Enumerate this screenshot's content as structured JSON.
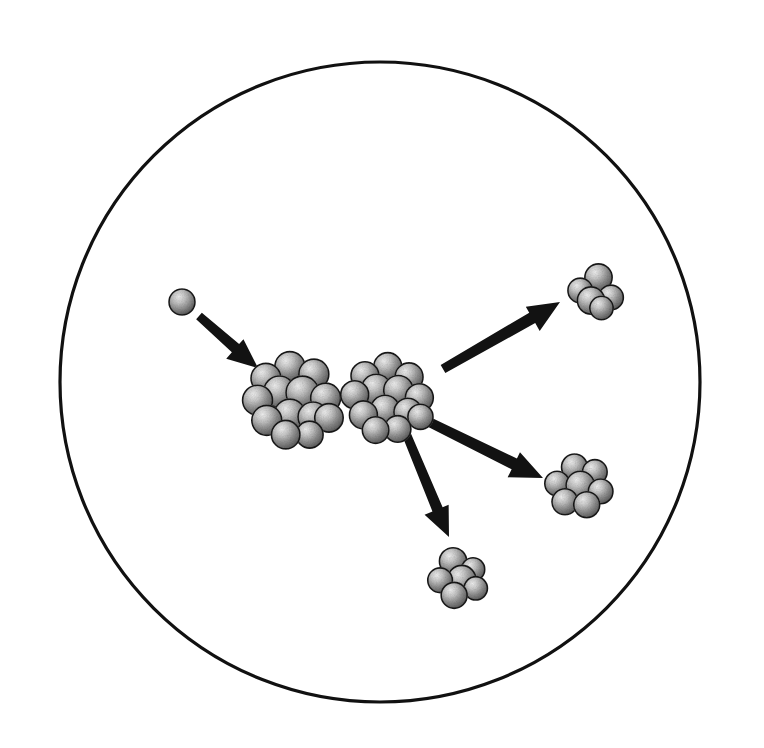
{
  "figure": {
    "title": "Nuclear fission of a heavy nucleus induced by a neutron",
    "background_color": "#ffffff",
    "outline_color": "#111111",
    "arrow_color": "#121212",
    "sphere_light": "#e8e8e8",
    "sphere_mid": "#8d8d8d",
    "sphere_dark": "#4a4a4a",
    "canvas": {
      "width": 764,
      "height": 748
    }
  },
  "vessel": {
    "name": "containment-circle",
    "center_x": 380,
    "center_y": 382,
    "radius": 320,
    "stroke_width": 3.2
  },
  "particles": [
    {
      "id": "incident-neutron",
      "label": "neutron",
      "kind": "single-nucleon",
      "center_x": 182,
      "center_y": 302,
      "radius": 13,
      "nucleon_count": 1
    },
    {
      "id": "target-nucleus",
      "label": "target nucleus",
      "kind": "cluster",
      "center_x": 292,
      "center_y": 396,
      "cluster_radius": 42,
      "nucleon_radius": 15,
      "nucleon_count": 13
    },
    {
      "id": "compound-nucleus",
      "label": "compound nucleus",
      "kind": "cluster",
      "center_x": 387,
      "center_y": 394,
      "cluster_radius": 38,
      "nucleon_radius": 14,
      "nucleon_count": 13
    },
    {
      "id": "fragment-upper-right",
      "label": "fission fragment",
      "kind": "cluster",
      "center_x": 594,
      "center_y": 293,
      "cluster_radius": 25,
      "nucleon_radius": 13,
      "nucleon_count": 5
    },
    {
      "id": "fragment-lower-right",
      "label": "fission fragment",
      "kind": "cluster",
      "center_x": 578,
      "center_y": 485,
      "cluster_radius": 29,
      "nucleon_radius": 13,
      "nucleon_count": 7
    },
    {
      "id": "fragment-bottom",
      "label": "fission fragment",
      "kind": "cluster",
      "center_x": 459,
      "center_y": 577,
      "cluster_radius": 27,
      "nucleon_radius": 13,
      "nucleon_count": 6
    }
  ],
  "arrows": [
    {
      "id": "arrow-incoming-neutron",
      "label": "incoming neutron path",
      "x1": 199,
      "y1": 316,
      "x2": 258,
      "y2": 368,
      "shaft_width": 11,
      "head_length": 30,
      "head_width": 28
    },
    {
      "id": "arrow-fragment-upper-right",
      "label": "fragment emission up-right",
      "x1": 443,
      "y1": 369,
      "x2": 560,
      "y2": 302,
      "shaft_width": 12,
      "head_length": 32,
      "head_width": 30
    },
    {
      "id": "arrow-fragment-lower-right",
      "label": "fragment emission down-right",
      "x1": 421,
      "y1": 418,
      "x2": 543,
      "y2": 478,
      "shaft_width": 12,
      "head_length": 32,
      "head_width": 30
    },
    {
      "id": "arrow-fragment-bottom",
      "label": "fragment emission downward",
      "x1": 403,
      "y1": 426,
      "x2": 449,
      "y2": 537,
      "shaft_width": 11,
      "head_length": 30,
      "head_width": 28
    }
  ],
  "cluster_layouts": {
    "target-nucleus": [
      [
        -0.62,
        -0.42,
        1.0
      ],
      [
        -0.05,
        -0.7,
        1.0
      ],
      [
        0.52,
        -0.52,
        1.0
      ],
      [
        -0.82,
        0.1,
        1.0
      ],
      [
        -0.3,
        -0.1,
        1.05
      ],
      [
        0.25,
        -0.08,
        1.1
      ],
      [
        0.8,
        0.05,
        1.0
      ],
      [
        -0.6,
        0.58,
        1.0
      ],
      [
        -0.05,
        0.45,
        1.05
      ],
      [
        0.5,
        0.5,
        1.0
      ],
      [
        0.88,
        0.52,
        0.95
      ],
      [
        -0.15,
        0.92,
        0.95
      ],
      [
        0.42,
        0.92,
        0.9
      ]
    ],
    "compound-nucleus": [
      [
        -0.58,
        -0.48,
        1.0
      ],
      [
        0.02,
        -0.72,
        1.0
      ],
      [
        0.58,
        -0.45,
        1.0
      ],
      [
        -0.85,
        0.02,
        1.0
      ],
      [
        -0.28,
        -0.12,
        1.08
      ],
      [
        0.3,
        -0.1,
        1.05
      ],
      [
        0.85,
        0.1,
        1.0
      ],
      [
        -0.62,
        0.55,
        1.0
      ],
      [
        -0.05,
        0.42,
        1.05
      ],
      [
        0.55,
        0.48,
        1.0
      ],
      [
        -0.3,
        0.95,
        0.95
      ],
      [
        0.28,
        0.92,
        0.95
      ],
      [
        0.88,
        0.6,
        0.9
      ]
    ],
    "fragment-upper-right": [
      [
        -0.55,
        -0.1,
        0.95
      ],
      [
        0.18,
        -0.62,
        1.05
      ],
      [
        -0.12,
        0.3,
        1.05
      ],
      [
        0.68,
        0.18,
        0.95
      ],
      [
        0.3,
        0.6,
        0.9
      ]
    ],
    "fragment-lower-right": [
      [
        -0.12,
        -0.62,
        1.0
      ],
      [
        0.58,
        -0.45,
        0.95
      ],
      [
        -0.72,
        -0.05,
        0.95
      ],
      [
        0.08,
        0.02,
        1.1
      ],
      [
        0.78,
        0.22,
        0.95
      ],
      [
        -0.45,
        0.58,
        1.0
      ],
      [
        0.3,
        0.68,
        1.0
      ]
    ],
    "fragment-bottom": [
      [
        -0.22,
        -0.58,
        1.05
      ],
      [
        0.52,
        -0.28,
        0.9
      ],
      [
        -0.7,
        0.12,
        0.95
      ],
      [
        0.1,
        0.1,
        1.1
      ],
      [
        0.62,
        0.42,
        0.9
      ],
      [
        -0.18,
        0.68,
        1.0
      ]
    ]
  }
}
